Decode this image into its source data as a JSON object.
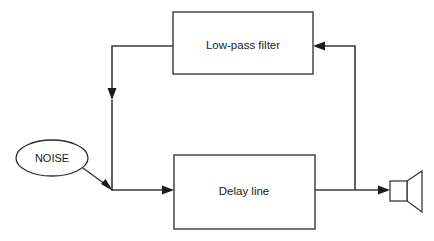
{
  "diagram": {
    "background_color": "#ffffff",
    "line_color": "#3a3a3a",
    "text_color": "#1a1a1a",
    "width": 434,
    "height": 241,
    "blocks": [
      {
        "id": "low-pass-filter",
        "label": "Low-pass filter",
        "shape": "rectangle",
        "x": 173,
        "y": 12,
        "width": 140,
        "height": 62,
        "label_x": 243,
        "label_y": 45
      },
      {
        "id": "delay-line",
        "label": "Delay line",
        "shape": "rectangle",
        "x": 174,
        "y": 155,
        "width": 141,
        "height": 74,
        "label_x": 244,
        "label_y": 191
      }
    ],
    "nodes": [
      {
        "id": "noise-source",
        "label": "NOISE",
        "shape": "ellipse",
        "cx": 52,
        "cy": 158,
        "rx": 36,
        "ry": 18
      }
    ],
    "speaker": {
      "id": "speaker-output",
      "label": "speaker",
      "box_x": 390,
      "box_y": 181,
      "box_width": 17,
      "box_height": 20,
      "horn_points": "407,181 422,172 422,211 407,201"
    },
    "connections": [
      {
        "id": "lpf-output-to-summing-node",
        "from": "low-pass-filter",
        "to": "summing-junction",
        "path": "M 173 46 L 112 46 L 112 97",
        "arrow_direction": "down",
        "arrow_x": 112,
        "arrow_y": 99
      },
      {
        "id": "summing-node-vertical-drop",
        "from": "summing-junction",
        "to": "delay-line",
        "path": "M 112 97 L 112 190 L 174 190",
        "arrow_direction": "right",
        "arrow_x": 174,
        "arrow_y": 190
      },
      {
        "id": "noise-to-summing-junction",
        "from": "noise-source",
        "to": "summing-junction",
        "path": "M 84 169 L 112 190",
        "arrow_direction": "down-right",
        "arrow_x": 112,
        "arrow_y": 190
      },
      {
        "id": "delay-line-to-speaker",
        "from": "delay-line",
        "to": "speaker-output",
        "path": "M 315 190 L 390 190",
        "arrow_direction": "right",
        "arrow_x": 390,
        "arrow_y": 190
      },
      {
        "id": "feedback-to-low-pass-filter",
        "from": "delay-line",
        "to": "low-pass-filter",
        "path": "M 355 190 L 355 46 L 313 46",
        "arrow_direction": "left",
        "arrow_x": 313,
        "arrow_y": 46
      }
    ],
    "junction_point": {
      "id": "summing-junction",
      "x": 112,
      "y": 190
    }
  }
}
